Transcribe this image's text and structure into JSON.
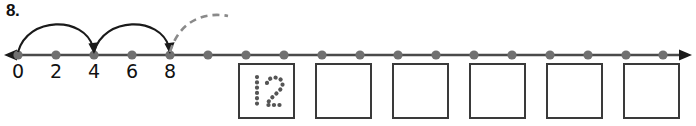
{
  "worksheet": {
    "problem_number": "8.",
    "instruction_type": "skip-counting-number-line"
  },
  "number_line": {
    "left_arrow": "left-arrowhead",
    "right_arrow": "right-arrowhead",
    "tick_count": 18,
    "labels": [
      {
        "value": "0",
        "x": 18
      },
      {
        "value": "2",
        "x": 56
      },
      {
        "value": "4",
        "x": 94
      },
      {
        "value": "6",
        "x": 132
      },
      {
        "value": "8",
        "x": 170
      }
    ],
    "jumps": [
      {
        "from": "0",
        "to": "4",
        "style": "solid",
        "arrowhead": true
      },
      {
        "from": "4",
        "to": "8",
        "style": "solid",
        "arrowhead": true
      },
      {
        "from": "8",
        "to": "12",
        "style": "dashed",
        "arrowhead": false
      }
    ]
  },
  "answer_boxes": [
    {
      "value": "12",
      "filled": true,
      "style": "dotted-trace"
    },
    {
      "value": "",
      "filled": false,
      "style": "empty"
    },
    {
      "value": "",
      "filled": false,
      "style": "empty"
    },
    {
      "value": "",
      "filled": false,
      "style": "empty"
    },
    {
      "value": "",
      "filled": false,
      "style": "empty"
    },
    {
      "value": "",
      "filled": false,
      "style": "empty"
    }
  ],
  "colors": {
    "ink": "#111111",
    "line": "#4a4a4a",
    "dot": "#707070",
    "box_border": "#3a3a3a",
    "trace": "#555555"
  }
}
